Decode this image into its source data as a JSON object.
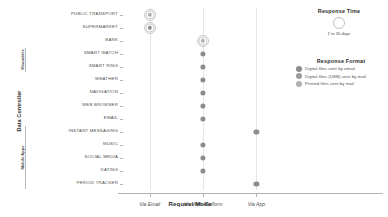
{
  "chart_data": {
    "type": "scatter",
    "title": "",
    "xlabel": "Request Mode",
    "ylabel": "Data Controller",
    "x_categories": [
      "Via Email",
      "Via Web Platform",
      "Via App"
    ],
    "y_categories": [
      "PUBLIC TRANSPORT",
      "SUPERMARKET",
      "BANK",
      "SMART WATCH",
      "SMART RING",
      "WEATHER",
      "NAVIGATION",
      "WEB BROWSER",
      "EMAIL",
      "INSTANT MESSAGING",
      "MUSIC",
      "SOCIAL MEDIA",
      "DATING",
      "PERIOD TRACKER"
    ],
    "y_groups": [
      {
        "label": "Wearables",
        "from": "SMART WATCH",
        "to": "SMART RING"
      },
      {
        "label": "Mobile Apps",
        "from": "INSTANT MESSAGING",
        "to": "PERIOD TRACKER"
      }
    ],
    "grid": true,
    "legend_position": "right",
    "points": [
      {
        "y": "PUBLIC TRANSPORT",
        "x": "Via Email",
        "format": "Printed files sent by mail",
        "response_time": 30
      },
      {
        "y": "SUPERMARKET",
        "x": "Via Email",
        "format": "Digital files sent by email",
        "response_time": 30
      },
      {
        "y": "BANK",
        "x": "Via Web Platform",
        "format": "Printed files sent by mail",
        "response_time": 30
      },
      {
        "y": "SMART WATCH",
        "x": "Via Web Platform",
        "format": "Digital files sent by email",
        "response_time": 1
      },
      {
        "y": "SMART RING",
        "x": "Via Web Platform",
        "format": "Digital files sent by email",
        "response_time": 1
      },
      {
        "y": "WEATHER",
        "x": "Via Web Platform",
        "format": "Digital files sent by email",
        "response_time": 1
      },
      {
        "y": "NAVIGATION",
        "x": "Via Web Platform",
        "format": "Digital files sent by email",
        "response_time": 1
      },
      {
        "y": "WEB BROWSER",
        "x": "Via Web Platform",
        "format": "Digital files sent by email",
        "response_time": 1
      },
      {
        "y": "EMAIL",
        "x": "Via Web Platform",
        "format": "Digital files sent by email",
        "response_time": 1
      },
      {
        "y": "INSTANT MESSAGING",
        "x": "Via App",
        "format": "Digital files sent by email",
        "response_time": 1
      },
      {
        "y": "MUSIC",
        "x": "Via Web Platform",
        "format": "Digital files sent by email",
        "response_time": 1
      },
      {
        "y": "SOCIAL MEDIA",
        "x": "Via Web Platform",
        "format": "Digital files sent by email",
        "response_time": 1
      },
      {
        "y": "DATING",
        "x": "Via Web Platform",
        "format": "Digital files sent by email",
        "response_time": 1
      },
      {
        "y": "PERIOD TRACKER",
        "x": "Via App",
        "format": "Digital files sent by email",
        "response_time": 1
      }
    ]
  },
  "legends": {
    "size": {
      "title": "Response Time",
      "caption": "1 to 30 days"
    },
    "format": {
      "title": "Response Format",
      "items": [
        {
          "label": "Digital files sent by email",
          "color": "#8c8c8c"
        },
        {
          "label": "Digital files (USB) sent by mail",
          "color": "#9a9a9a"
        },
        {
          "label": "Printed files sent by mail",
          "color": "#b0b0b0"
        }
      ]
    }
  },
  "colors": {
    "marker": "#8a8a8a",
    "ring": "#c8c8c8",
    "grid": "#e6e6e6",
    "axis": "#b5b5b5",
    "text": "#4d4d4d"
  }
}
